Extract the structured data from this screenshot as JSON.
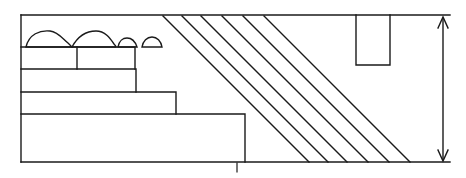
{
  "figure": {
    "type": "technical-line-drawing",
    "width": 466,
    "height": 178,
    "background_color": "#ffffff",
    "stroke_color": "#1a1a1a",
    "stroke_width": 1.4,
    "ground_line": {
      "name": "baseline",
      "x1": 21,
      "y1": 162,
      "x2": 450,
      "y2": 162
    },
    "top_line": {
      "name": "top-reference-line",
      "x1": 21,
      "y1": 15,
      "x2": 450,
      "y2": 15
    },
    "left_edge": {
      "name": "left-vertical-edge",
      "x1": 21,
      "y1": 15,
      "x2": 21,
      "y2": 162
    },
    "steps": [
      {
        "label": "step-1-top",
        "x": 24,
        "y": 47,
        "w": 53,
        "h": 22
      },
      {
        "label": "step-1-top-right",
        "x": 77,
        "y": 47,
        "w": 58,
        "h": 22
      },
      {
        "label": "step-2",
        "x": 24,
        "y": 69,
        "w": 112,
        "h": 23
      },
      {
        "label": "step-3",
        "x": 24,
        "y": 92,
        "w": 152,
        "h": 22
      },
      {
        "label": "step-4-base",
        "x": 24,
        "y": 114,
        "w": 221,
        "h": 48
      }
    ],
    "mounds": [
      {
        "label": "mound-large-left",
        "x": 26,
        "y": 47,
        "w": 42,
        "h": 18
      },
      {
        "label": "mound-large-right",
        "x": 70,
        "y": 47,
        "w": 44,
        "h": 18
      },
      {
        "label": "mound-small-a",
        "x": 117,
        "y": 47,
        "w": 20,
        "h": 11
      },
      {
        "label": "mound-small-b",
        "x": 141,
        "y": 47,
        "w": 21,
        "h": 11
      }
    ],
    "hatch": {
      "label": "diagonal-hatch-slope",
      "line_count": 6,
      "angle_deg": 45,
      "top_start_x": 163,
      "top_spacing": 19,
      "bottom_start_x": 278,
      "bottom_spacing": 33
    },
    "notch": {
      "label": "top-notch-rectangle",
      "x": 356,
      "y": 15,
      "w": 34,
      "h": 50
    },
    "dimension_arrow": {
      "label": "height-dimension-arrow",
      "x": 443,
      "y_top": 18,
      "y_bottom": 160,
      "double_headed": true
    },
    "tick_mark": {
      "label": "baseline-tick",
      "x": 237,
      "y_top": 164,
      "y_bottom": 172
    }
  }
}
